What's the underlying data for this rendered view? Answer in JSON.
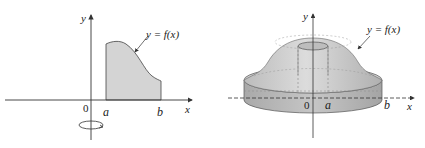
{
  "left_figure": {
    "y_axis_label": "y",
    "x_axis_label": "x",
    "origin_label": "0",
    "a_label": "a",
    "b_label": "b",
    "curve_label": "y = f(x)",
    "rotation_icon": "rotation-arrow-icon"
  },
  "right_figure": {
    "y_axis_label": "y",
    "x_axis_label": "x",
    "origin_label": "0",
    "a_label": "a",
    "b_label": "b",
    "curve_label": "y = f(x)"
  },
  "colors": {
    "region_fill": "#d4d4d4",
    "solid_light": "#d9d9d9",
    "solid_mid": "#c2c2c2",
    "solid_dark": "#a8a8a8",
    "axis": "#333333"
  }
}
